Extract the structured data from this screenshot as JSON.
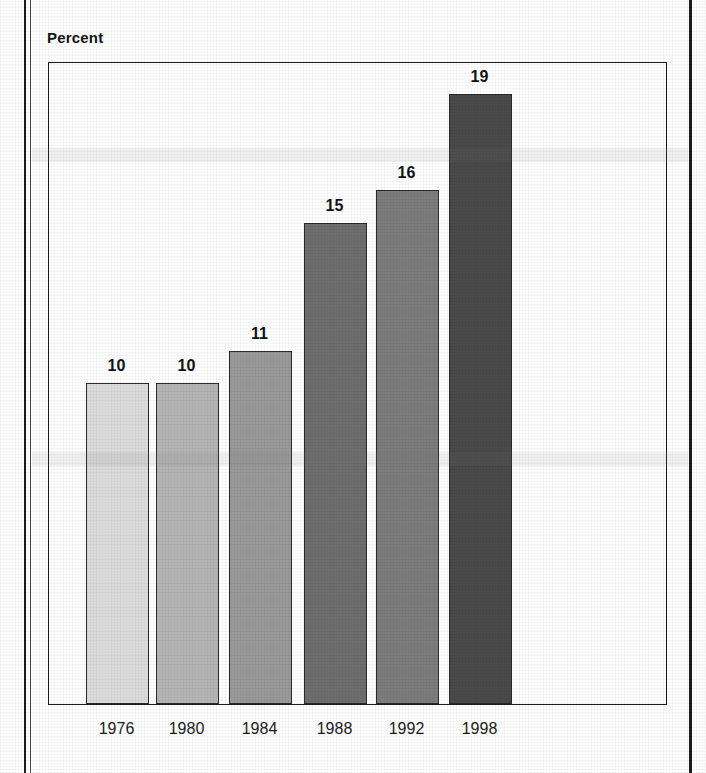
{
  "figure": {
    "axis_title": "Percent"
  },
  "chart_data": {
    "type": "bar",
    "title": "",
    "subtitle": "",
    "xlabel": "",
    "ylabel": "Percent",
    "categories": [
      "1976",
      "1980",
      "1984",
      "1988",
      "1992",
      "1998"
    ],
    "values": [
      10,
      10,
      11,
      15,
      16,
      19
    ],
    "value_labels": [
      "10",
      "10",
      "11",
      "15",
      "16",
      "19"
    ],
    "series": [
      {
        "name": "Percent",
        "values": [
          10,
          10,
          11,
          15,
          16,
          19
        ]
      }
    ],
    "ylim": [
      0,
      20
    ],
    "grid": false,
    "y_axis_ticks_visible": false,
    "legend": "none",
    "bar_colors": [
      "#dcdcdc",
      "#b5b5b5",
      "#9a9a9a",
      "#6e6e6e",
      "#7d7d7d",
      "#4a4a4a"
    ],
    "bar_border_color": "#2a2a2a",
    "frame_color": "#1a1a1a",
    "background_color": "#ffffff",
    "text_color": "#121212"
  }
}
